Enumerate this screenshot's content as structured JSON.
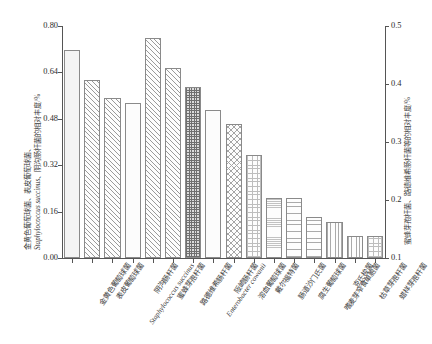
{
  "chart_data": {
    "type": "bar",
    "title": "",
    "xlabel": "",
    "ylabel_left_line1": "金黄色葡萄球菌、表皮葡萄球菌、",
    "ylabel_left_line2": "Staphylococcus succinus、阴沟肠杆菌的相对丰度/%",
    "ylabel_right": "蜜蜂芽孢杆菌、路德维希肠杆菌等的相对丰度/%",
    "ylim_left": [
      0.0,
      0.8
    ],
    "ylim_right": [
      0.1,
      0.5
    ],
    "yticks_left": [
      "0.00",
      "0.16",
      "0.32",
      "0.48",
      "0.64",
      "0.80"
    ],
    "ytick_values_left": [
      0.0,
      0.16,
      0.32,
      0.48,
      0.64,
      0.8
    ],
    "yticks_right": [
      "0.1",
      "0.2",
      "0.3",
      "0.4",
      "0.5"
    ],
    "ytick_values_right": [
      0.1,
      0.2,
      0.3,
      0.4,
      0.5
    ],
    "grid": false,
    "legend": "none",
    "categories": [
      "金黄色葡萄球菌",
      "表皮葡萄球菌",
      "Staphylococcus succinus",
      "阴沟肠杆菌",
      "蜜蜂芽孢杆菌",
      "路德维希肠杆菌",
      "Enterobacter cowanii",
      "阪崎肠杆菌",
      "溶血葡萄球菌",
      "戴尔福特菌",
      "肠道沙门氏菌",
      "腐生葡萄球菌",
      "嗜麦芽窄食单胞菌",
      "克氏梭菌",
      "枯草芽孢杆菌",
      "蜡样芽孢杆菌"
    ],
    "values": [
      0.718,
      0.613,
      0.551,
      0.533,
      0.758,
      0.655,
      0.588,
      0.512,
      0.462,
      0.355,
      0.207,
      0.206,
      0.143,
      0.124,
      0.077,
      0.075
    ],
    "patterns": [
      "solid",
      "diagonal",
      "diagonal",
      "plain",
      "diagonal",
      "diagonal",
      "dots-dark",
      "plain",
      "cross",
      "grid",
      "fine-horizontal",
      "horizontal",
      "horizontal",
      "vertical",
      "vertical",
      "grid"
    ]
  },
  "axis": {
    "left_title_line1": "金黄色葡萄球菌、表皮葡萄球菌、",
    "left_title_line2_sci": "Staphylococcus succinus",
    "left_title_line2_rest": "、阴沟肠杆菌的相对丰度/%",
    "right_title": "蜜蜂芽孢杆菌、路德维希肠杆菌等的相对丰度/%"
  }
}
